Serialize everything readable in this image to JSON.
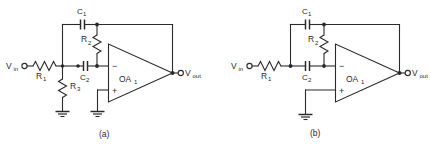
{
  "figure": {
    "background_color": "#ffffff",
    "line_color": "#2a2a2a"
  },
  "circuits": [
    {
      "id": "circuit-a",
      "caption": "(a)",
      "input_label": "V",
      "input_sub": "in",
      "output_label": "V",
      "output_sub": "out",
      "opamp_label": "OA",
      "opamp_sub": "1",
      "inverting_sign": "−",
      "noninverting_sign": "+",
      "components": [
        {
          "name": "C1",
          "label": "C",
          "sub": "1",
          "type": "capacitor",
          "orientation": "horizontal"
        },
        {
          "name": "R2",
          "label": "R",
          "sub": "2",
          "type": "resistor",
          "orientation": "vertical"
        },
        {
          "name": "C2",
          "label": "C",
          "sub": "2",
          "type": "capacitor",
          "orientation": "horizontal"
        },
        {
          "name": "R1",
          "label": "R",
          "sub": "1",
          "type": "resistor",
          "orientation": "horizontal"
        },
        {
          "name": "R3",
          "label": "R",
          "sub": "3",
          "type": "resistor",
          "orientation": "vertical"
        }
      ],
      "grounds": 2
    },
    {
      "id": "circuit-b",
      "caption": "(b)",
      "input_label": "V",
      "input_sub": "in",
      "output_label": "V",
      "output_sub": "out",
      "opamp_label": "OA",
      "opamp_sub": "1",
      "inverting_sign": "−",
      "noninverting_sign": "+",
      "components": [
        {
          "name": "C1",
          "label": "C",
          "sub": "1",
          "type": "capacitor",
          "orientation": "horizontal"
        },
        {
          "name": "R2",
          "label": "R",
          "sub": "2",
          "type": "resistor",
          "orientation": "vertical"
        },
        {
          "name": "C2",
          "label": "C",
          "sub": "2",
          "type": "capacitor",
          "orientation": "horizontal"
        },
        {
          "name": "R1",
          "label": "R",
          "sub": "1",
          "type": "resistor",
          "orientation": "horizontal"
        }
      ],
      "grounds": 1
    }
  ]
}
